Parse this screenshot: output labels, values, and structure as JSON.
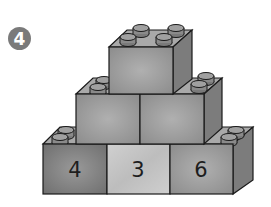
{
  "question_number": "4",
  "pyramid": {
    "rows": [
      {
        "level": "top",
        "blocks": [
          ""
        ]
      },
      {
        "level": "middle",
        "blocks": [
          "",
          ""
        ]
      },
      {
        "level": "bottom",
        "blocks": [
          "4",
          "3",
          "6"
        ]
      }
    ]
  },
  "colors": {
    "badge": "#7a7a7a",
    "block_front": "#9a9a9a",
    "block_front_light": "#c4c4c4",
    "block_front_dark": "#7f7f7f",
    "block_side": "#7c7c7c",
    "block_top": "#a9a9a9",
    "stud": "#8a8a8a",
    "outline": "#1a1a1a"
  }
}
